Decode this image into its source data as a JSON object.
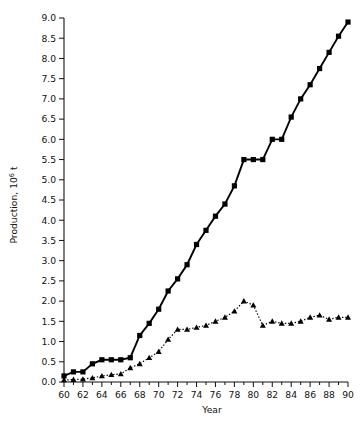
{
  "chart_data": {
    "type": "line",
    "title": "",
    "xlabel": "Year",
    "ylabel": "Production, 10⁶ t",
    "ylabel_text": "Production, 10",
    "ylabel_sup": "6",
    "ylabel_unit": " t",
    "xlim": [
      60,
      90
    ],
    "ylim": [
      0,
      9.0
    ],
    "grid": false,
    "legend": "none",
    "x_ticks": [
      60,
      62,
      64,
      66,
      68,
      70,
      72,
      74,
      76,
      78,
      80,
      82,
      84,
      86,
      88,
      90
    ],
    "x_tick_labels": [
      "60",
      "62",
      "64",
      "66",
      "68",
      "70",
      "72",
      "74",
      "76",
      "78",
      "80",
      "82",
      "84",
      "86",
      "88",
      "90"
    ],
    "x_minor_step": 1,
    "y_ticks": [
      0.0,
      0.5,
      1.0,
      1.5,
      2.0,
      2.5,
      3.0,
      3.5,
      4.0,
      4.5,
      5.0,
      5.5,
      6.0,
      6.5,
      7.0,
      7.5,
      8.0,
      8.5,
      9.0
    ],
    "y_tick_labels": [
      "0.0",
      "0.5",
      "1.0",
      "1.5",
      "2.0",
      "2.5",
      "3.0",
      "3.5",
      "4.0",
      "4.5",
      "5.0",
      "5.5",
      "6.0",
      "6.5",
      "7.0",
      "7.5",
      "8.0",
      "8.5",
      "9.0"
    ],
    "x": [
      60,
      61,
      62,
      63,
      64,
      65,
      66,
      67,
      68,
      69,
      70,
      71,
      72,
      73,
      74,
      75,
      76,
      77,
      78,
      79,
      80,
      81,
      82,
      83,
      84,
      85,
      86,
      87,
      88,
      89,
      90
    ],
    "series": [
      {
        "name": "series-squares",
        "marker": "square",
        "linestyle": "solid",
        "color": "#000000",
        "values": [
          0.15,
          0.25,
          0.25,
          0.45,
          0.55,
          0.55,
          0.55,
          0.6,
          1.15,
          1.45,
          1.8,
          2.25,
          2.55,
          2.9,
          3.4,
          3.75,
          4.1,
          4.4,
          4.85,
          5.5,
          5.5,
          5.5,
          6.0,
          6.0,
          6.55,
          7.0,
          7.35,
          7.75,
          8.15,
          8.55,
          8.9
        ]
      },
      {
        "name": "series-triangles",
        "marker": "triangle",
        "linestyle": "dotted",
        "color": "#000000",
        "values": [
          0.05,
          0.06,
          0.07,
          0.1,
          0.15,
          0.18,
          0.2,
          0.35,
          0.45,
          0.6,
          0.75,
          1.05,
          1.3,
          1.3,
          1.35,
          1.4,
          1.5,
          1.6,
          1.75,
          2.0,
          1.9,
          1.4,
          1.5,
          1.45,
          1.45,
          1.5,
          1.6,
          1.65,
          1.55,
          1.6,
          1.6
        ]
      }
    ]
  },
  "axes": {
    "x_axis_title": "Year"
  }
}
